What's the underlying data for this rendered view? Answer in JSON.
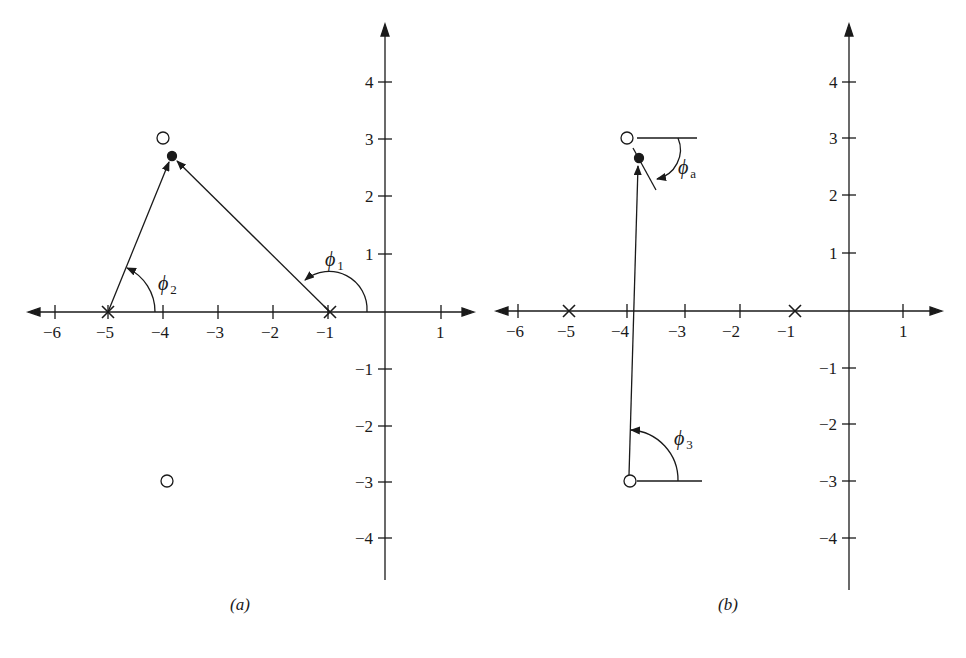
{
  "colors": {
    "ink": "#1a1a1a",
    "background": "#ffffff"
  },
  "panel_a": {
    "caption": "(a)",
    "x_ticks": [
      "−6",
      "−5",
      "−4",
      "−3",
      "−2",
      "−1",
      "1"
    ],
    "y_ticks": [
      "4",
      "3",
      "2",
      "1",
      "−1",
      "−2",
      "−3",
      "−4"
    ],
    "poles": [
      {
        "re": -5,
        "im": 0
      },
      {
        "re": -1,
        "im": 0
      }
    ],
    "zeros": [
      {
        "re": -4,
        "im": 3
      },
      {
        "re": -4,
        "im": -3
      }
    ],
    "test_point": {
      "re": -3.8,
      "im": 2.7
    },
    "angle_labels": {
      "phi1": "ϕ",
      "phi1_sub": "1",
      "phi2": "ϕ",
      "phi2_sub": "2"
    }
  },
  "panel_b": {
    "caption": "(b)",
    "x_ticks": [
      "−6",
      "−5",
      "−4",
      "−3",
      "−2",
      "−1",
      "1"
    ],
    "y_ticks": [
      "4",
      "3",
      "2",
      "1",
      "−1",
      "−2",
      "−3",
      "−4"
    ],
    "poles": [
      {
        "re": -5,
        "im": 0
      },
      {
        "re": -1,
        "im": 0
      }
    ],
    "zeros": [
      {
        "re": -4,
        "im": 3
      },
      {
        "re": -4,
        "im": -3
      }
    ],
    "test_point": {
      "re": -3.8,
      "im": 2.7
    },
    "angle_labels": {
      "phia": "ϕ",
      "phia_sub": "a",
      "phi3": "ϕ",
      "phi3_sub": "3"
    }
  }
}
